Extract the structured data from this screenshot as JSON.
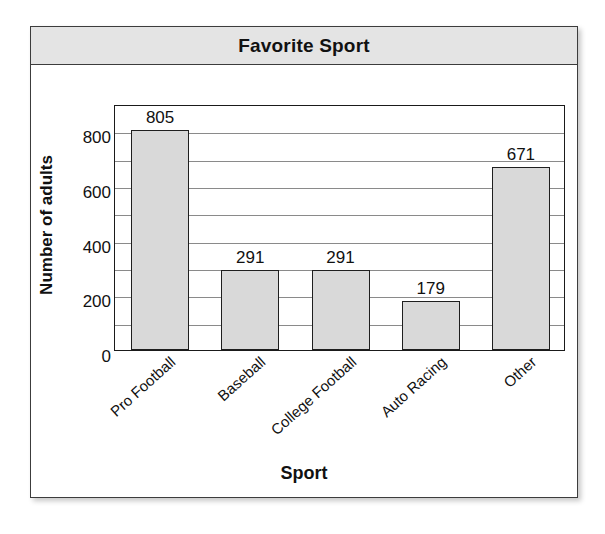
{
  "card": {
    "title": "Favorite Sport"
  },
  "chart_data": {
    "type": "bar",
    "title": "Favorite Sport",
    "xlabel": "Sport",
    "ylabel": "Number of adults",
    "categories": [
      "Pro Football",
      "Baseball",
      "College Football",
      "Auto Racing",
      "Other"
    ],
    "values": [
      805,
      291,
      291,
      179,
      671
    ],
    "value_labels": [
      "805",
      "291",
      "291",
      "179",
      "671"
    ],
    "ylim": [
      0,
      900
    ],
    "yticks": [
      0,
      200,
      400,
      600,
      800
    ],
    "ytick_labels": [
      "0",
      "200",
      "400",
      "600",
      "800"
    ],
    "gridlines": [
      100,
      200,
      300,
      400,
      500,
      600,
      700,
      800
    ],
    "grid": true,
    "legend": "none",
    "bar_fill_color": "#d9d9d9",
    "bar_edge_color": "#1f1f1f",
    "title_bar_color": "#e4e4e4"
  }
}
